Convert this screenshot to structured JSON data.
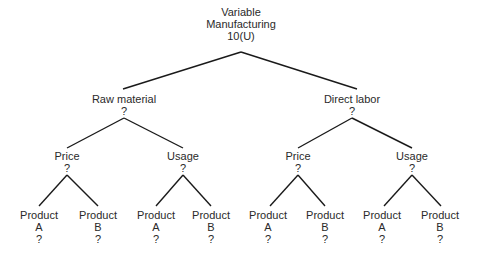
{
  "diagram": {
    "type": "tree",
    "root": {
      "lines": [
        "Variable",
        "Manufacturing",
        "10(U)"
      ]
    },
    "level1": [
      {
        "label": "Raw material",
        "value": "?"
      },
      {
        "label": "Direct labor",
        "value": "?"
      }
    ],
    "level2": [
      {
        "label": "Price",
        "value": "?"
      },
      {
        "label": "Usage",
        "value": "?"
      },
      {
        "label": "Price",
        "value": "?"
      },
      {
        "label": "Usage",
        "value": "?"
      }
    ],
    "level3": [
      {
        "label": "Product",
        "sub": "A",
        "value": "?"
      },
      {
        "label": "Product",
        "sub": "B",
        "value": "?"
      },
      {
        "label": "Product",
        "sub": "A",
        "value": "?"
      },
      {
        "label": "Product",
        "sub": "B",
        "value": "?"
      },
      {
        "label": "Product",
        "sub": "A",
        "value": "?"
      },
      {
        "label": "Product",
        "sub": "B",
        "value": "?"
      },
      {
        "label": "Product",
        "sub": "A",
        "value": "?"
      },
      {
        "label": "Product",
        "sub": "B",
        "value": "?"
      }
    ],
    "line_color": "#1a1a1a"
  }
}
